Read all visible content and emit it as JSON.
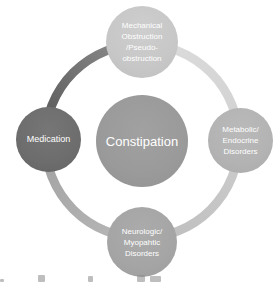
{
  "diagram": {
    "type": "cycle",
    "center": {
      "label": "Constipation"
    },
    "nodes": {
      "mechanical": {
        "full_label": "Mechanical Obstruction /Pseudo-obstruction",
        "lines": [
          "Mechanical",
          "Obstruction",
          "/Pseudo-",
          "obstruction"
        ]
      },
      "metabolic": {
        "full_label": "Metabolic/ Endocrine Disorders",
        "lines": [
          "Metabolic/",
          "Endocrine",
          "Disorders"
        ]
      },
      "neurologic": {
        "full_label": "Neurologic/ Myopahtic Disorders",
        "lines": [
          "Neurologic/",
          "Myopahtic",
          "Disorders"
        ]
      },
      "medication": {
        "full_label": "Medication",
        "lines": [
          "Medication"
        ]
      }
    },
    "colors": {
      "background": "#ffffff",
      "label_text": "#ffffff",
      "node_mechanical": "#c7c7c7",
      "node_metabolic": "#b3b3b3",
      "node_neurologic": "#a5a5a5",
      "node_medication": "#6d6d6d",
      "node_center": "#9a9a9a",
      "ring_top_left_segment": "#5e5e5e",
      "ring_top_right_segment": "#d8d8d8",
      "ring_bottom_right_segment": "#c6c6c6",
      "ring_bottom_left_segment": "#aeaeae"
    }
  }
}
